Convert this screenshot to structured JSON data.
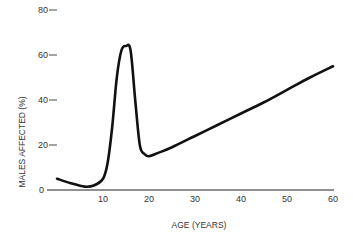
{
  "chart_data": {
    "type": "line",
    "title": "",
    "xlabel": "AGE (YEARS)",
    "ylabel": "MALES AFFECTED (%)",
    "xlim": [
      0,
      60
    ],
    "ylim": [
      0,
      80
    ],
    "x_ticks": [
      "10",
      "20",
      "30",
      "40",
      "50",
      "60"
    ],
    "y_ticks": [
      "0",
      "20",
      "40",
      "60",
      "80"
    ],
    "grid": false,
    "legend": null,
    "series": [
      {
        "name": "Males affected",
        "x": [
          0,
          3,
          6,
          8,
          10,
          11,
          12,
          13,
          14,
          15,
          16,
          17,
          18,
          19,
          20,
          22,
          25,
          30,
          35,
          40,
          45,
          50,
          55,
          60
        ],
        "values": [
          5,
          3,
          1.5,
          2,
          5,
          12,
          28,
          50,
          62,
          64,
          62,
          40,
          20,
          16,
          15,
          16.5,
          19,
          24,
          29,
          34,
          39,
          44.5,
          50,
          55
        ]
      }
    ]
  }
}
